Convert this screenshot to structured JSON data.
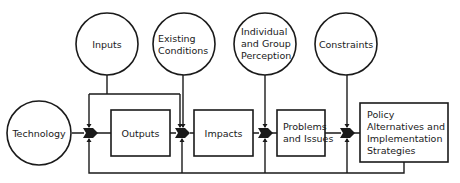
{
  "diagram": {
    "type": "flow-diagram",
    "colors": {
      "stroke": "#1a1a1a",
      "fill": "#ffffff",
      "text": "#1a1a1a"
    },
    "circles": {
      "technology": {
        "lines": [
          "Technology"
        ]
      },
      "inputs": {
        "lines": [
          "Inputs"
        ]
      },
      "existing_conditions": {
        "lines": [
          "Existing",
          "Conditions"
        ]
      },
      "perception": {
        "lines": [
          "Individual",
          "and Group",
          "Perception"
        ]
      },
      "constraints": {
        "lines": [
          "Constraints"
        ]
      }
    },
    "boxes": {
      "outputs": {
        "lines": [
          "Outputs"
        ]
      },
      "impacts": {
        "lines": [
          "Impacts"
        ]
      },
      "problems": {
        "lines": [
          "Problems",
          "and Issues"
        ]
      },
      "policy": {
        "lines": [
          "Policy",
          "Alternatives and",
          "Implementation",
          "Strategies"
        ]
      }
    },
    "flow": [
      "Technology",
      "Outputs",
      "Impacts",
      "Problems and Issues",
      "Policy Alternatives and Implementation Strategies"
    ],
    "feedback": "Policy Alternatives and Implementation Strategies feeds back to all junctions"
  }
}
